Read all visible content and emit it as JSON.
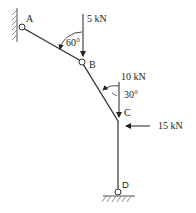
{
  "diagram": {
    "type": "structural frame with pinned supports",
    "nodes": [
      {
        "id": "A",
        "label": "A",
        "support": "pin (wall, left)"
      },
      {
        "id": "B",
        "label": "B",
        "support": "internal hinge"
      },
      {
        "id": "C",
        "label": "C",
        "support": "joint"
      },
      {
        "id": "D",
        "label": "D",
        "support": "pin (ground)"
      }
    ],
    "members": [
      {
        "from": "A",
        "to": "B"
      },
      {
        "from": "B",
        "to": "C"
      },
      {
        "from": "C",
        "to": "D"
      }
    ],
    "loads": [
      {
        "label": "5 kN",
        "at": "B",
        "direction": "down"
      },
      {
        "label": "10 kN",
        "at": "C",
        "direction": "down"
      },
      {
        "label": "15 kN",
        "at": "C",
        "direction": "left"
      }
    ],
    "angles": [
      {
        "label": "60°",
        "between": "member AB and 5 kN load"
      },
      {
        "label": "30°",
        "between": "member BC and 10 kN load"
      }
    ],
    "colors": {
      "line": "#333333",
      "hatch": "#666666",
      "background": "#ffffff"
    }
  }
}
